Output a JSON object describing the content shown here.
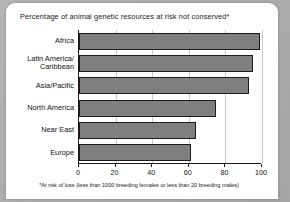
{
  "chart_data": {
    "type": "bar",
    "orientation": "horizontal",
    "title": "Percentage of animal genetic resources at risk not conserved*",
    "categories": [
      "Africa",
      "Latin America/\nCaribbean",
      "Asia/Pacific",
      "North America",
      "Near East",
      "Europe"
    ],
    "values": [
      99,
      95,
      93,
      75,
      64,
      61
    ],
    "xlabel": "",
    "ylabel": "",
    "xlim": [
      0,
      100
    ],
    "xticks": [
      0,
      20,
      40,
      60,
      80,
      100
    ],
    "xtick_labels": [
      "0",
      "20",
      "40",
      "60",
      "80",
      "100"
    ],
    "grid": true,
    "legend": null,
    "footnote": "*At risk of loss (less than 1000 breeding females or less than 20 breeding males)",
    "bar_color": "#7f7f7f",
    "bar_border_color": "#1c1c1c",
    "axis_color": "#1a1a1a",
    "grid_color": "#c9c9c9",
    "background_color": "#ffffff",
    "page_background_color": "#a9a9a9"
  }
}
